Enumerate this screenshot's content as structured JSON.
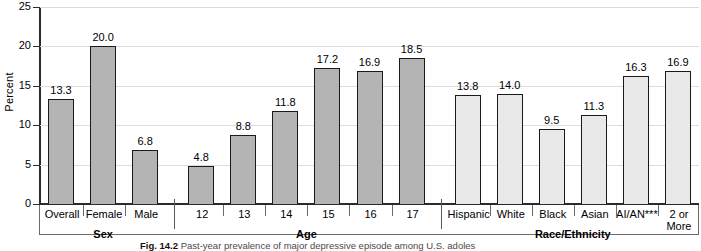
{
  "chart_data": {
    "type": "bar",
    "title": "",
    "xlabel": "",
    "ylabel": "Percent",
    "ylim": [
      0,
      25
    ],
    "yticks": [
      0,
      5,
      10,
      15,
      20,
      25
    ],
    "grid": true,
    "legend": "none",
    "categories": [
      "Overall",
      "Female",
      "Male",
      "12",
      "13",
      "14",
      "15",
      "16",
      "17",
      "Hispanic",
      "White",
      "Black",
      "Asian",
      "AI/AN***",
      "2 or\nMore"
    ],
    "values": [
      13.3,
      20.0,
      6.8,
      4.8,
      8.8,
      11.8,
      17.2,
      16.9,
      18.5,
      13.8,
      14.0,
      9.5,
      11.3,
      16.3,
      16.9
    ],
    "value_labels": [
      "13.3",
      "20.0",
      "6.8",
      "4.8",
      "8.8",
      "11.8",
      "17.2",
      "16.9",
      "18.5",
      "13.8",
      "14.0",
      "9.5",
      "11.3",
      "16.3",
      "16.9"
    ],
    "groups": [
      {
        "name": "Sex",
        "categories": [
          "Overall",
          "Female",
          "Male"
        ],
        "values": [
          13.3,
          20.0,
          6.8
        ],
        "shade": "dark"
      },
      {
        "name": "Age",
        "categories": [
          "12",
          "13",
          "14",
          "15",
          "16",
          "17"
        ],
        "values": [
          4.8,
          8.8,
          11.8,
          17.2,
          16.9,
          18.5
        ],
        "shade": "dark"
      },
      {
        "name": "Race/Ethnicity",
        "categories": [
          "Hispanic",
          "White",
          "Black",
          "Asian",
          "AI/AN***",
          "2 or\nMore"
        ],
        "values": [
          13.8,
          14.0,
          9.5,
          11.3,
          16.3,
          16.9
        ],
        "shade": "light"
      }
    ]
  },
  "axis": {
    "y_title": "Percent",
    "y_tick_labels": [
      "25",
      "20",
      "15",
      "10",
      "5",
      "0"
    ]
  },
  "group_titles": {
    "sex": "Sex",
    "age": "Age",
    "race": "Race/Ethnicity"
  },
  "colors": {
    "bar_dark": "#b4b4b4",
    "bar_light": "#e9e9e9",
    "bar_outline": "#1a1a1a",
    "axis": "#2b2b2b",
    "grid": "#dcdcdc",
    "background": "#ffffff"
  },
  "caption": {
    "figure_number": "Fig. 14.2",
    "text": "Past-year prevalence of major depressive episode among U.S. adoles"
  }
}
